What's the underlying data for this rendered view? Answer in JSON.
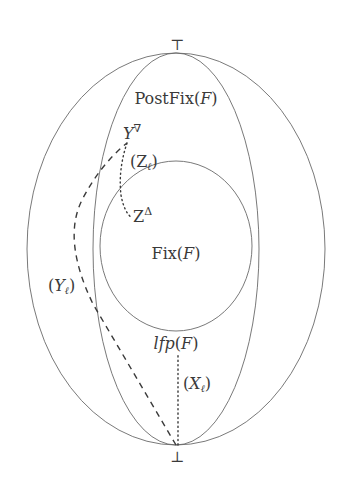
{
  "diagram": {
    "top_symbol": "⊤",
    "bottom_symbol": "⊥",
    "sets": {
      "outer": "lattice",
      "postfix_label": "PostFix(",
      "postfix_var": "F",
      "postfix_close": ")",
      "fix_label": "Fix(",
      "fix_var": "F",
      "fix_close": ")"
    },
    "points": {
      "y_nabla_base": "Y",
      "y_nabla_sup": "∇",
      "z_delta_base": "Z",
      "z_delta_sup": "Δ",
      "lfp_label": "lfp",
      "lfp_open": "(",
      "lfp_var": "F",
      "lfp_close": ")"
    },
    "sequences": {
      "z_seq_open": "(Z",
      "z_seq_sub": "ℓ",
      "z_seq_close": ")",
      "y_seq_open": "(",
      "y_seq_var": "Y",
      "y_seq_sub": "ℓ",
      "y_seq_close": ")",
      "x_seq_open": "(",
      "x_seq_var": "X",
      "x_seq_sub": "ℓ",
      "x_seq_close": ")"
    },
    "colors": {
      "stroke": "#6a6a6a",
      "text": "#3a3a3a",
      "background": "#ffffff"
    }
  }
}
